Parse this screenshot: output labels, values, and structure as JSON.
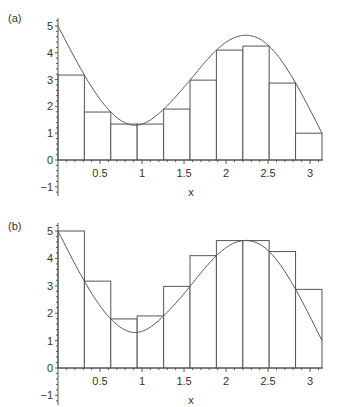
{
  "chart_data": [
    {
      "type": "bar",
      "panel_label": "(a)",
      "title": "",
      "description": "Lower Riemann sum (10 subintervals) under curve on [0, pi]",
      "xlabel": "x",
      "ylabel": "",
      "xlim": [
        0,
        3.1416
      ],
      "ylim": [
        -1.3,
        5.3
      ],
      "xticks": [
        "0.5",
        "1",
        "1.5",
        "2",
        "2.5",
        "3"
      ],
      "yticks": [
        "-1",
        "0",
        "1",
        "2",
        "3",
        "4",
        "5"
      ],
      "grid": false,
      "curve": {
        "x": [
          0,
          0.314,
          0.628,
          0.942,
          1.257,
          1.571,
          1.885,
          2.2,
          2.513,
          2.827,
          3.1416
        ],
        "y": [
          5.0,
          3.17,
          1.79,
          1.3,
          1.9,
          2.98,
          4.1,
          4.65,
          4.25,
          2.87,
          1.0
        ]
      },
      "bars": {
        "x_edges": [
          0,
          0.314,
          0.628,
          0.942,
          1.257,
          1.571,
          1.885,
          2.2,
          2.513,
          2.827,
          3.1416
        ],
        "values": [
          3.17,
          1.79,
          1.34,
          1.34,
          1.9,
          2.98,
          4.1,
          4.25,
          2.87,
          1.0
        ]
      }
    },
    {
      "type": "bar",
      "panel_label": "(b)",
      "title": "",
      "description": "Upper Riemann sum (10 subintervals) over curve on [0, pi]",
      "xlabel": "x",
      "ylabel": "",
      "xlim": [
        0,
        3.1416
      ],
      "ylim": [
        -1.3,
        5.3
      ],
      "xticks": [
        "0.5",
        "1",
        "1.5",
        "2",
        "2.5",
        "3"
      ],
      "yticks": [
        "-1",
        "0",
        "1",
        "2",
        "3",
        "4",
        "5"
      ],
      "grid": false,
      "curve": {
        "x": [
          0,
          0.314,
          0.628,
          0.942,
          1.257,
          1.571,
          1.885,
          2.2,
          2.513,
          2.827,
          3.1416
        ],
        "y": [
          5.0,
          3.17,
          1.79,
          1.3,
          1.9,
          2.98,
          4.1,
          4.65,
          4.25,
          2.87,
          1.0
        ]
      },
      "bars": {
        "x_edges": [
          0,
          0.314,
          0.628,
          0.942,
          1.257,
          1.571,
          1.885,
          2.2,
          2.513,
          2.827,
          3.1416
        ],
        "values": [
          5.0,
          3.17,
          1.79,
          1.9,
          2.98,
          4.1,
          4.65,
          4.65,
          4.25,
          2.87
        ]
      }
    }
  ],
  "style": {
    "line_color": "#555555",
    "bar_fill": "#ffffff",
    "text_color": "#333333"
  }
}
